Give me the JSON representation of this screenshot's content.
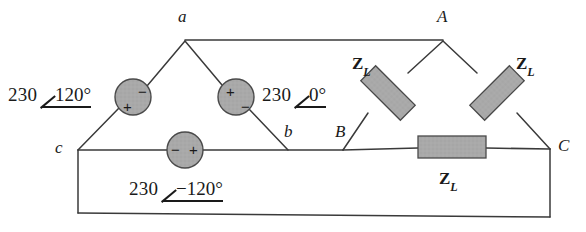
{
  "diagram": {
    "stroke_color": "#3a3a3a",
    "component_fill": "#a8a8a8",
    "component_stroke": "#4a4a4a",
    "text_color": "#1a1a1a"
  },
  "nodes": [
    {
      "id": "a",
      "label": "a",
      "x": 185,
      "y": 40,
      "label_x": 178,
      "label_y": 7
    },
    {
      "id": "b",
      "label": "b",
      "x": 288,
      "y": 150,
      "label_x": 284,
      "label_y": 122
    },
    {
      "id": "c",
      "label": "c",
      "x": 78,
      "y": 150,
      "label_x": 55,
      "label_y": 138
    },
    {
      "id": "A",
      "label": "A",
      "x": 443,
      "y": 40,
      "label_x": 437,
      "label_y": 7
    },
    {
      "id": "B",
      "label": "B",
      "x": 343,
      "y": 150,
      "label_x": 335,
      "label_y": 122
    },
    {
      "id": "C",
      "label": "C",
      "x": 550,
      "y": 149,
      "label_x": 558,
      "label_y": 136
    }
  ],
  "sources": [
    {
      "name": "source-ca",
      "cx": 133,
      "cy": 97,
      "r": 18,
      "plus": "+",
      "minus": "−",
      "plus_x": 123,
      "plus_y": 99,
      "minus_x": 138,
      "minus_y": 84,
      "phasor": {
        "magnitude": "230",
        "angle": "120°",
        "x": 8,
        "y": 84
      }
    },
    {
      "name": "source-ab",
      "cx": 236,
      "cy": 97,
      "r": 18,
      "plus": "+",
      "minus": "−",
      "plus_x": 226,
      "plus_y": 84,
      "minus_x": 241,
      "minus_y": 99,
      "phasor": {
        "magnitude": "230",
        "angle": "0°",
        "x": 262,
        "y": 84
      }
    },
    {
      "name": "source-bc",
      "cx": 185,
      "cy": 150,
      "r": 18,
      "plus": "+",
      "minus": "−",
      "plus_x": 189,
      "plus_y": 142,
      "minus_x": 171,
      "minus_y": 142,
      "phasor": {
        "magnitude": "230",
        "angle": "−120°",
        "x": 129,
        "y": 178
      }
    }
  ],
  "impedances": [
    {
      "name": "impedance-ab",
      "label": "Z",
      "sub": "L",
      "cx": 388,
      "cy": 93,
      "w": 56,
      "h": 21,
      "rotate": 45,
      "label_x": 352,
      "label_y": 54
    },
    {
      "name": "impedance-ca",
      "label": "Z",
      "sub": "L",
      "cx": 497,
      "cy": 93,
      "w": 56,
      "h": 21,
      "rotate": -45,
      "label_x": 516,
      "label_y": 54
    },
    {
      "name": "impedance-bc",
      "label": "Z",
      "sub": "L",
      "cx": 452,
      "cy": 147,
      "w": 68,
      "h": 22,
      "rotate": 0,
      "label_x": 439,
      "label_y": 169
    }
  ],
  "wires": {
    "a_to_A": {
      "x1": 185,
      "y1": 40,
      "x2": 443,
      "y2": 40
    },
    "c_to_B": {
      "x1": 78,
      "y1": 150,
      "x2": 343,
      "y2": 150
    },
    "B_to_C": {
      "x1": 343,
      "y1": 150,
      "x2": 550,
      "y2": 149
    },
    "outer_left": {
      "x1": 78,
      "y1": 150,
      "x2": 78,
      "y2": 213
    },
    "outer_bottom": {
      "x1": 78,
      "y1": 213,
      "x2": 550,
      "y2": 217
    },
    "outer_right": {
      "x1": 550,
      "y1": 149,
      "x2": 550,
      "y2": 217
    }
  }
}
